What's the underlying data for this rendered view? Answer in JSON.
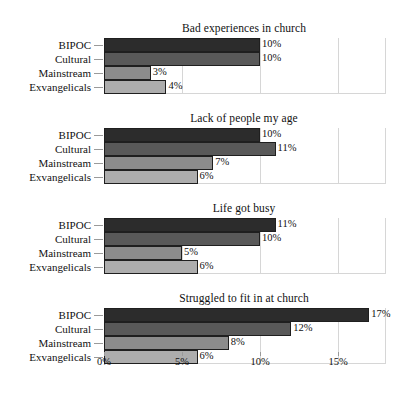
{
  "chart_data": {
    "type": "bar",
    "orientation": "horizontal",
    "title": "",
    "xlabel": "",
    "ylabel": "",
    "xlim": [
      0,
      18
    ],
    "grid": true,
    "legend": "none",
    "xticks": [
      "0%",
      "5%",
      "10%",
      "15%"
    ],
    "xtick_values": [
      0,
      5,
      10,
      15
    ],
    "categories": [
      "BIPOC",
      "Cultural",
      "Mainstream",
      "Exvangelicals"
    ],
    "panels": [
      {
        "title": "Bad experiences in church",
        "values": [
          10,
          10,
          3,
          4
        ],
        "labels": [
          "10%",
          "10%",
          "3%",
          "4%"
        ]
      },
      {
        "title": "Lack of people my age",
        "values": [
          10,
          11,
          7,
          6
        ],
        "labels": [
          "10%",
          "11%",
          "7%",
          "6%"
        ]
      },
      {
        "title": "Life got busy",
        "values": [
          11,
          10,
          5,
          6
        ],
        "labels": [
          "11%",
          "10%",
          "5%",
          "6%"
        ]
      },
      {
        "title": "Struggled to fit in at church",
        "values": [
          17,
          12,
          8,
          6
        ],
        "labels": [
          "17%",
          "12%",
          "8%",
          "6%"
        ]
      }
    ],
    "series_colors": [
      "#2c2c2c",
      "#595959",
      "#8c8c8c",
      "#adadad"
    ]
  },
  "colors": {
    "bar_bipoc": "#2c2c2c",
    "bar_cultural": "#595959",
    "bar_mainstream": "#8c8c8c",
    "bar_exvangelicals": "#adadad",
    "gridline": "#d6d6d6",
    "bar_outline": "#1f1f1f",
    "text": "#111111",
    "background": "#ffffff"
  }
}
